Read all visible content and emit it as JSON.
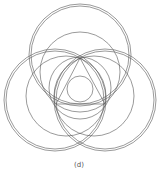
{
  "caption": "(d)",
  "colors": {
    "stroke": "#555555",
    "background": "#ffffff"
  },
  "figure": {
    "double_circles": [
      {
        "cx": 80,
        "cy": 55,
        "r_outer": 51,
        "r_inner": 49
      },
      {
        "cx": 55,
        "cy": 100,
        "r_outer": 51,
        "r_inner": 49
      },
      {
        "cx": 105,
        "cy": 100,
        "r_outer": 51,
        "r_inner": 49
      }
    ],
    "medium_circles": [
      {
        "cx": 80,
        "cy": 72,
        "r": 40
      },
      {
        "cx": 66,
        "cy": 96,
        "r": 40
      },
      {
        "cx": 94,
        "cy": 96,
        "r": 40
      }
    ],
    "lens_circles": [
      {
        "cx": 80,
        "cy": 88,
        "r": 31
      }
    ],
    "triangle": [
      [
        80,
        58
      ],
      [
        56,
        104
      ],
      [
        105,
        104
      ]
    ],
    "incircle": {
      "cx": 80,
      "cy": 89,
      "r": 13
    }
  }
}
